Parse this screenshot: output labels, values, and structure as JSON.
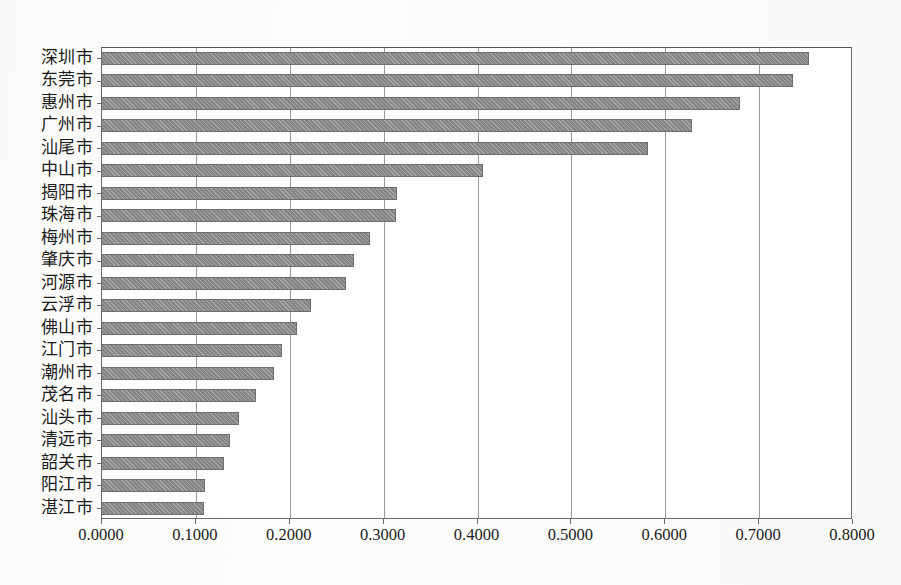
{
  "chart_data": {
    "type": "bar",
    "orientation": "horizontal",
    "title": "",
    "subtitle": "",
    "xlabel": "",
    "ylabel": "",
    "xlim": [
      0.0,
      0.8
    ],
    "xticks": [
      0.0,
      0.1,
      0.2,
      0.3,
      0.4,
      0.5,
      0.6,
      0.7,
      0.8
    ],
    "xtick_labels": [
      "0.0000",
      "0.1000",
      "0.2000",
      "0.3000",
      "0.4000",
      "0.5000",
      "0.6000",
      "0.7000",
      "0.8000"
    ],
    "grid": "vertical",
    "legend": null,
    "legend_position": "none",
    "bar_color": "#8d8d8d",
    "bar_edge_color": "#6e6e6e",
    "axis_color": "#6a6a6a",
    "gridline_color": "#9a9a9a",
    "categories": [
      "深圳市",
      "东莞市",
      "惠州市",
      "广州市",
      "汕尾市",
      "中山市",
      "揭阳市",
      "珠海市",
      "梅州市",
      "肇庆市",
      "河源市",
      "云浮市",
      "佛山市",
      "江门市",
      "潮州市",
      "茂名市",
      "汕头市",
      "清远市",
      "韶关市",
      "阳江市",
      "湛江市"
    ],
    "values": [
      0.753,
      0.736,
      0.68,
      0.629,
      0.582,
      0.406,
      0.314,
      0.313,
      0.285,
      0.268,
      0.26,
      0.223,
      0.208,
      0.192,
      0.183,
      0.164,
      0.146,
      0.136,
      0.13,
      0.11,
      0.109
    ]
  }
}
